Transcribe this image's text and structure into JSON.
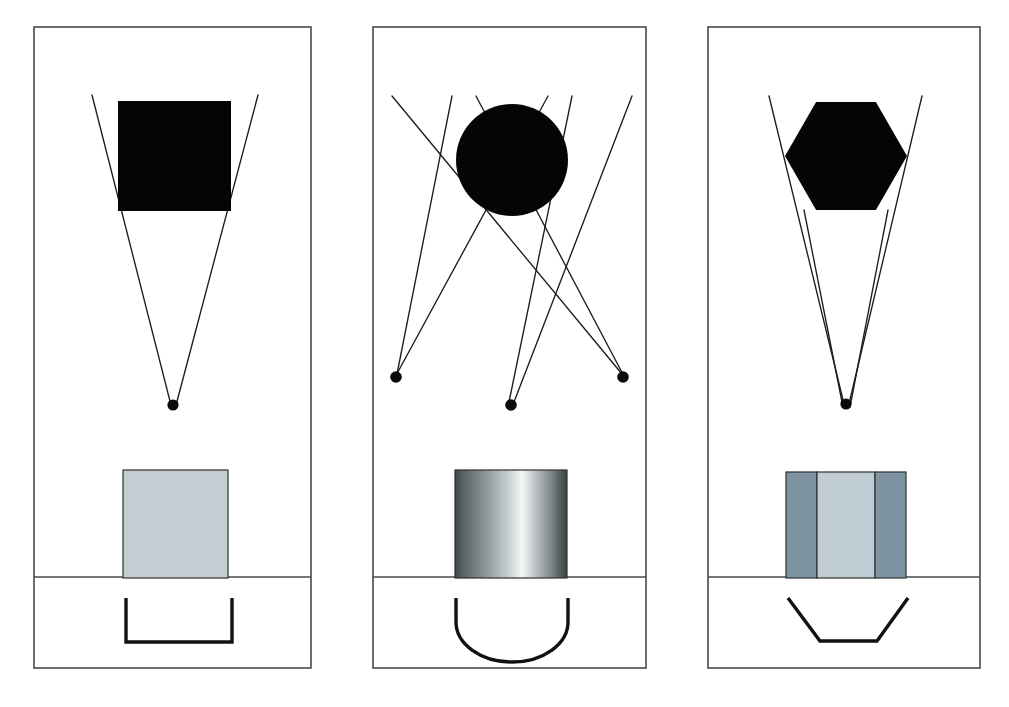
{
  "figure": {
    "background_color": "#ffffff",
    "width": 1009,
    "height": 707,
    "frame_stroke_color": "#4a4a4a",
    "ray_stroke_color": "#1c1c1c",
    "silhouette_color": "#050505",
    "caption": "                                                                                    "
  },
  "panels": [
    {
      "id": "panel-a",
      "label": "a",
      "frame": {
        "x": 34,
        "y": 27,
        "width": 277,
        "height": 641
      },
      "divider_y": 577,
      "silhouette": {
        "shape": "square",
        "name": "black-square-aperture",
        "x": 118,
        "y": 101,
        "width": 113,
        "height": 110,
        "color": "#050505"
      },
      "focus_dots": [
        {
          "cx": 173,
          "cy": 405,
          "r": 5.6
        }
      ],
      "rays": [
        {
          "x1": 92,
          "y1": 95,
          "x2": 172,
          "y2": 409
        },
        {
          "x1": 258,
          "y1": 95,
          "x2": 175,
          "y2": 409
        }
      ],
      "element": {
        "name": "flat-plate-element",
        "type": "solid",
        "x": 123,
        "y": 470,
        "width": 105,
        "height": 108,
        "fill": "#c3ced3",
        "stroke": "#2f2f2f",
        "bands": []
      },
      "bracket": {
        "name": "flat-bottom-bracket",
        "type": "u-square",
        "path": "M 126 598 L 126 642 L 232 642 L 232 598",
        "stroke": "#111111"
      }
    },
    {
      "id": "panel-b",
      "label": "b",
      "frame": {
        "x": 373,
        "y": 27,
        "width": 273,
        "height": 641
      },
      "divider_y": 577,
      "silhouette": {
        "shape": "circle",
        "name": "black-circle-aperture",
        "cx": 512,
        "cy": 160,
        "r": 56,
        "color": "#050505"
      },
      "focus_dots": [
        {
          "cx": 396,
          "cy": 377,
          "r": 5.8
        },
        {
          "cx": 511,
          "cy": 405,
          "r": 5.8
        },
        {
          "cx": 623,
          "cy": 377,
          "r": 5.8
        }
      ],
      "rays": [
        {
          "x1": 392,
          "y1": 96,
          "x2": 622,
          "y2": 374
        },
        {
          "x1": 452,
          "y1": 96,
          "x2": 397,
          "y2": 374
        },
        {
          "x1": 476,
          "y1": 96,
          "x2": 626,
          "y2": 380
        },
        {
          "x1": 548,
          "y1": 96,
          "x2": 393,
          "y2": 381
        },
        {
          "x1": 572,
          "y1": 96,
          "x2": 509,
          "y2": 402
        },
        {
          "x1": 632,
          "y1": 96,
          "x2": 514,
          "y2": 402
        }
      ],
      "element": {
        "name": "cylindrical-lens-element",
        "type": "gradient",
        "x": 455,
        "y": 470,
        "width": 112,
        "height": 108,
        "fill": "metal-gradient",
        "stroke": "#2f2f2f",
        "gradient_stops": [
          "#3f4548",
          "#8f989c",
          "#f4f6f6",
          "#9aa2a6",
          "#3d4346"
        ]
      },
      "bracket": {
        "name": "semicircle-bracket",
        "type": "u-round",
        "path": "M 456 598 L 456 622 A 56 40 0 0 0 568 622 L 568 598",
        "stroke": "#111111"
      }
    },
    {
      "id": "panel-c",
      "label": "c",
      "frame": {
        "x": 708,
        "y": 27,
        "width": 272,
        "height": 641
      },
      "divider_y": 577,
      "silhouette": {
        "shape": "hexagon",
        "name": "black-hexagon-aperture",
        "cx": 846,
        "cy": 156,
        "width": 122,
        "height": 108,
        "color": "#050505"
      },
      "focus_dots": [
        {
          "cx": 846,
          "cy": 404,
          "r": 5.6
        }
      ],
      "rays": [
        {
          "x1": 769,
          "y1": 96,
          "x2": 845,
          "y2": 408
        },
        {
          "x1": 922,
          "y1": 96,
          "x2": 848,
          "y2": 408
        },
        {
          "x1": 804,
          "y1": 210,
          "x2": 843,
          "y2": 407
        },
        {
          "x1": 888,
          "y1": 210,
          "x2": 850,
          "y2": 407
        }
      ],
      "element": {
        "name": "three-band-prism-element",
        "type": "banded",
        "x": 786,
        "y": 472,
        "width": 120,
        "height": 106,
        "fill": "#7e94a3",
        "stroke": "#2f2f2f",
        "bands": [
          {
            "offset": 0,
            "width": 31,
            "fill": "#7e94a3"
          },
          {
            "offset": 31,
            "width": 58,
            "fill": "#c0ccd3"
          },
          {
            "offset": 89,
            "width": 31,
            "fill": "#7e94a3"
          }
        ]
      },
      "bracket": {
        "name": "trapezoid-bracket",
        "type": "trapezoid",
        "path": "M 788 598 L 820 641 L 877 641 L 908 598",
        "stroke": "#111111"
      }
    }
  ]
}
